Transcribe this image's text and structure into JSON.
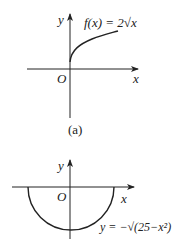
{
  "graph_a": {
    "y_label": "y",
    "x_label": "x",
    "origin_label": "O",
    "function_label": "f(x) = 2√x",
    "caption": "(a)"
  },
  "graph_b": {
    "y_label": "y",
    "x_label": "x",
    "origin_label": "O",
    "function_label": "y = −√(25−x²)"
  },
  "colors": {
    "ink": "#222222",
    "background": "#ffffff"
  }
}
